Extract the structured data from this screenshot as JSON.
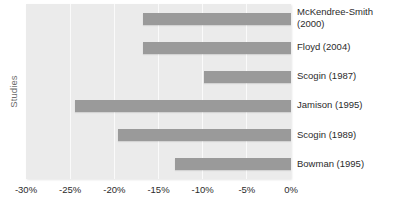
{
  "chart_data": {
    "type": "bar",
    "orientation": "horizontal",
    "title": "",
    "xlabel": "",
    "ylabel": "Studies",
    "categories": [
      "McKendree-Smith\n(2000)",
      "Floyd (2004)",
      "Scogin (1987)",
      "Jamison (1995)",
      "Scogin (1989)",
      "Bowman (1995)"
    ],
    "values": [
      -16.7,
      -16.7,
      -9.8,
      -24.5,
      -19.6,
      -13.1
    ],
    "xlim": [
      -30,
      0
    ],
    "xticks": [
      -30,
      -25,
      -20,
      -15,
      -10,
      -5,
      0
    ],
    "xticklabels": [
      "-30%",
      "-25%",
      "-20%",
      "-15%",
      "-10%",
      "-5%",
      "0%"
    ],
    "grid": true,
    "legend": "none",
    "bar_color": "#9a9a9a",
    "plot_background": "#ebebeb",
    "gridline_color": "#fafafa"
  }
}
